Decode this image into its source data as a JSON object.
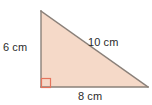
{
  "figure": {
    "kind": "right-triangle-diagram",
    "unit": "cm",
    "fill_color": "#f5d9c8",
    "stroke_color": "#8a8079",
    "right_angle_marker_color": "#e4745c",
    "label_color": "#2b2b2b",
    "background_color": "#ffffff",
    "vertices": {
      "apex": [
        41,
        11
      ],
      "right_angle": [
        41,
        87
      ],
      "right_vertex": [
        148,
        87
      ]
    },
    "labels": {
      "vertical_leg": "6 cm",
      "hypotenuse": "10 cm",
      "horizontal_leg": "8 cm"
    },
    "right_angle_marker": {
      "x": 41,
      "y": 78,
      "size": 9
    }
  },
  "chart_data": {
    "type": "diagram",
    "title": "",
    "shape": "right triangle",
    "sides": [
      {
        "name": "vertical leg",
        "label": "6 cm",
        "value": 6,
        "unit": "cm"
      },
      {
        "name": "horizontal leg",
        "label": "8 cm",
        "value": 8,
        "unit": "cm"
      },
      {
        "name": "hypotenuse",
        "label": "10 cm",
        "value": 10,
        "unit": "cm"
      }
    ],
    "angles": [
      {
        "name": "right angle",
        "value": 90,
        "unit": "degrees",
        "marked": true
      }
    ]
  }
}
